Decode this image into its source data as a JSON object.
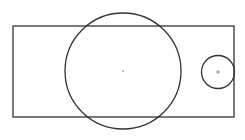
{
  "diagram": {
    "canvas": {
      "width": 245,
      "height": 140,
      "background": "#ffffff"
    },
    "stroke_color": "#333333",
    "center_mark_color": "#555555",
    "rectangle": {
      "x": 13,
      "y": 26,
      "width": 221,
      "height": 91
    },
    "large_circle": {
      "cx": 123,
      "cy": 71,
      "r": 58,
      "center_mark": "dot"
    },
    "small_circle": {
      "cx": 218,
      "cy": 72,
      "r": 16.5,
      "center_mark": "cross"
    }
  }
}
